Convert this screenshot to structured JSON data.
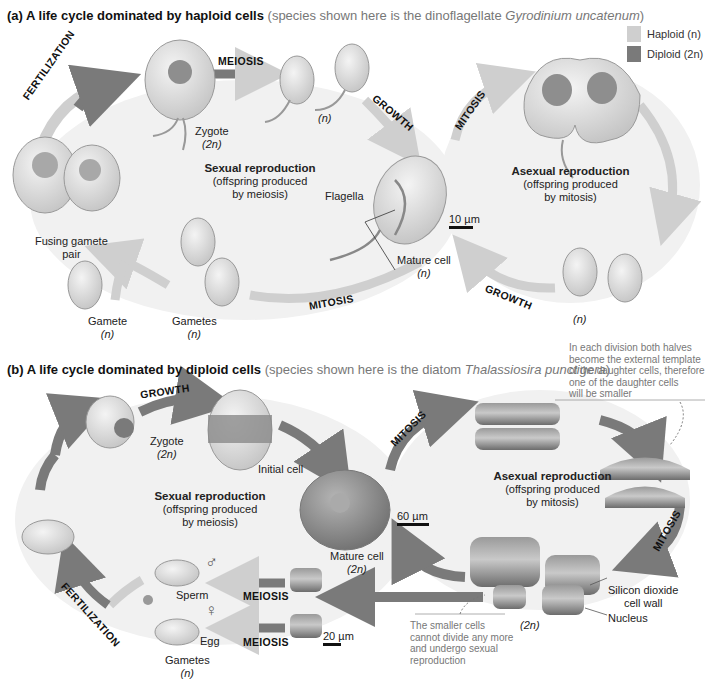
{
  "legend": {
    "haploid_label": "Haploid (n)",
    "diploid_label": "Diploid (2n)",
    "haploid_color": "#cfcfcf",
    "diploid_color": "#7a7a7a"
  },
  "panel_a": {
    "title": "(a) A life cycle dominated by haploid cells",
    "subtitle_prefix": "(species shown here is the dinoflagellate ",
    "species": "Gyrodinium uncatenum",
    "subtitle_suffix": ")",
    "steps": {
      "fertilization": "FERTILIZATION",
      "meiosis": "MEIOSIS",
      "growth_top": "GROWTH",
      "mitosis_top": "MITOSIS",
      "growth_bottom": "GROWTH",
      "mitosis_bottom": "MITOSIS"
    },
    "labels": {
      "zygote": "Zygote",
      "zygote_ploidy": "(2n)",
      "meiosis_products_ploidy": "(n)",
      "fusing_gamete_pair_1": "Fusing gamete",
      "fusing_gamete_pair_2": "pair",
      "flagella": "Flagella",
      "mature_cell": "Mature cell",
      "mature_cell_ploidy": "(n)",
      "gamete": "Gamete",
      "gamete_ploidy": "(n)",
      "gametes": "Gametes",
      "gametes_ploidy": "(n)",
      "daughter_ploidy": "(n)",
      "scale": "10 µm"
    },
    "sexual": {
      "heading": "Sexual reproduction",
      "line1": "(offspring produced",
      "line2": "by meiosis)"
    },
    "asexual": {
      "heading": "Asexual reproduction",
      "line1": "(offspring produced",
      "line2": "by mitosis)"
    }
  },
  "panel_b": {
    "title": "(b) A life cycle dominated by diploid cells",
    "subtitle_prefix": "(species shown here is the diatom ",
    "species": "Thalassiosira punctigera",
    "subtitle_suffix": ")",
    "steps": {
      "growth": "GROWTH",
      "mitosis_top": "MITOSIS",
      "mitosis_right": "MITOSIS",
      "fertilization": "FERTILIZATION",
      "meiosis_1": "MEIOSIS",
      "meiosis_2": "MEIOSIS"
    },
    "labels": {
      "zygote": "Zygote",
      "zygote_ploidy": "(2n)",
      "initial_cell": "Initial cell",
      "mature_cell": "Mature cell",
      "mature_cell_ploidy": "(2n)",
      "scale_large": "60 µm",
      "scale_small": "20 µm",
      "sperm": "Sperm",
      "egg": "Egg",
      "male_symbol": "♂",
      "female_symbol": "♀",
      "gametes": "Gametes",
      "gametes_ploidy": "(n)",
      "small_cells_ploidy": "(2n)",
      "silicon_wall_1": "Silicon dioxide",
      "silicon_wall_2": "cell wall",
      "nucleus": "Nucleus"
    },
    "sexual": {
      "heading": "Sexual reproduction",
      "line1": "(offspring produced",
      "line2": "by meiosis)"
    },
    "asexual": {
      "heading": "Asexual reproduction",
      "line1": "(offspring produced",
      "line2": "by mitosis)"
    },
    "note_top": [
      "In each division both halves",
      "become the external template",
      "of the daughter cells, therefore",
      "one of the daughter cells",
      "will be smaller"
    ],
    "note_bottom": [
      "The smaller cells",
      "cannot divide any more",
      "and undergo sexual",
      "reproduction"
    ]
  }
}
